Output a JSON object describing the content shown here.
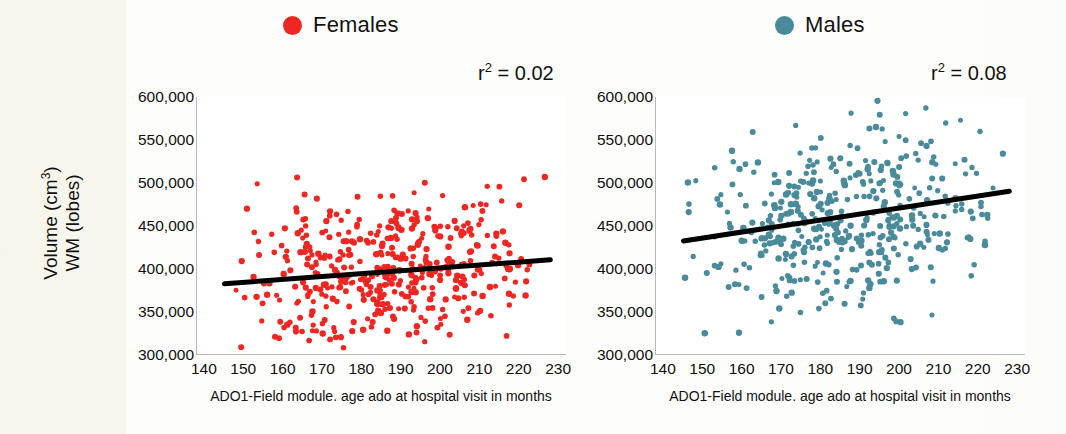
{
  "legend": {
    "items": [
      {
        "label": "Females",
        "color": "#ee2722",
        "icon": "circle-marker-icon"
      },
      {
        "label": "Males",
        "color": "#4a8b9b",
        "icon": "circle-marker-icon"
      }
    ]
  },
  "axes": {
    "y_label_line1": "Volume (cm³)",
    "y_label_line2": "WM (lobes)",
    "x_label": "ADO1-Field module. age ado at hospital visit in months",
    "y_ticks": [
      "600,000",
      "550,000",
      "500,000",
      "450,000",
      "400,000",
      "350,000",
      "300,000"
    ],
    "x_ticks": [
      "140",
      "150",
      "160",
      "170",
      "180",
      "190",
      "200",
      "210",
      "220",
      "230"
    ]
  },
  "panels": {
    "females": {
      "r2_text": "r² = 0.02",
      "r2_value": 0.02
    },
    "males": {
      "r2_text": "r² = 0.08",
      "r2_value": 0.08
    }
  },
  "chart_data": [
    {
      "type": "scatter",
      "name": "Females",
      "title": "",
      "xlabel": "ADO1-Field module. age ado at hospital visit in months",
      "ylabel": "Volume (cm3) WM (lobes)",
      "xlim": [
        138,
        232
      ],
      "ylim": [
        300000,
        600000
      ],
      "grid": false,
      "marker_color": "#ee2722",
      "marker_size": 5,
      "r_squared": 0.02,
      "n_points": 430,
      "trendline": {
        "color": "#000000",
        "width": 5,
        "x": [
          145,
          228
        ],
        "y": [
          382000,
          410000
        ]
      },
      "point_cloud_summary": {
        "x_range": [
          143,
          229
        ],
        "y_mean": 392000,
        "y_sd": 46000,
        "y_range": [
          300000,
          510000
        ],
        "density_peak_x": 175,
        "description": "Dense red cloud spanning 143-229 months, volumes mostly 310,000-500,000, centered near 390,000 with a very slight positive slope."
      },
      "annotations": [
        {
          "text": "r2 = 0.02",
          "x": 205,
          "y": 585000
        }
      ]
    },
    {
      "type": "scatter",
      "name": "Males",
      "title": "",
      "xlabel": "ADO1-Field module. age ado at hospital visit in months",
      "ylabel": "Volume (cm3) WM (lobes)",
      "xlim": [
        138,
        232
      ],
      "ylim": [
        300000,
        600000
      ],
      "grid": false,
      "marker_color": "#4a8b9b",
      "marker_size": 5,
      "r_squared": 0.08,
      "n_points": 430,
      "trendline": {
        "color": "#000000",
        "width": 5,
        "x": [
          145,
          228
        ],
        "y": [
          432000,
          490000
        ]
      },
      "point_cloud_summary": {
        "x_range": [
          143,
          229
        ],
        "y_mean": 466000,
        "y_sd": 52000,
        "y_range": [
          320000,
          615000
        ],
        "density_peak_x": 180,
        "description": "Dense teal cloud spanning 143-229 months, volumes mostly 370,000-580,000, centered near 466,000 with a clear positive slope."
      },
      "annotations": [
        {
          "text": "r2 = 0.08",
          "x": 205,
          "y": 585000
        }
      ]
    }
  ]
}
